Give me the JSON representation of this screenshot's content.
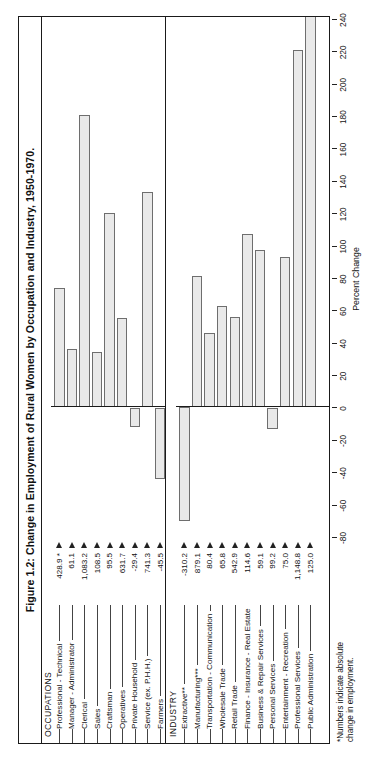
{
  "figure": {
    "title": "Figure 1.2: Change in Employment of Rural Women by Occupation and Industry, 1950-1970.",
    "footnote_line1": "*Numbers indicate absolute",
    "footnote_line2": "change in employment."
  },
  "axis": {
    "label": "Percent Change",
    "ticks": [
      "-80",
      "-60",
      "-40",
      "-20",
      "0",
      "20",
      "40",
      "60",
      "80",
      "100",
      "120",
      "140",
      "160",
      "180",
      "200",
      "220",
      "240"
    ]
  },
  "sections": {
    "occupations_title": "OCCUPATIONS",
    "industry_title": "INDUSTRY"
  },
  "chart_data": {
    "type": "bar",
    "orientation": "horizontal",
    "title": "Figure 1.2: Change in Employment of Rural Women by Occupation and Industry, 1950-1970.",
    "xlabel": "Percent Change",
    "ylabel": "",
    "xlim": [
      -80,
      240
    ],
    "grid": false,
    "legend": null,
    "note": "Value labels shown beside each category are the absolute change in employment (thousands); bar length is percent change.",
    "panels": [
      {
        "name": "OCCUPATIONS",
        "categories": [
          "Professional - Technical",
          "Manager - Administrator",
          "Clerical",
          "Sales",
          "Craftsman",
          "Operatives",
          "Private Household",
          "Service (ex. P.H.H.)",
          "Farmers",
          "Farm Labor",
          "Labor (ex. Farm)"
        ],
        "value_labels": [
          "428.9 *",
          "61.1",
          "1,083.2",
          "108.5",
          "95.5",
          "631.7",
          "-29.4",
          "741.3",
          "-45.5",
          "-324.4",
          ""
        ],
        "absolute_change": [
          428.9,
          61.1,
          1083.2,
          108.5,
          95.5,
          631.7,
          -29.4,
          741.3,
          -45.5,
          -324.4,
          null
        ],
        "percent_change": [
          74,
          36,
          181,
          34,
          120,
          55,
          -12,
          133,
          -44,
          -71,
          108
        ]
      },
      {
        "name": "INDUSTRY",
        "categories": [
          "Extractive**",
          "Manufacturing***",
          "Transportation - Communication",
          "Wholesale Trade",
          "Retail Trade",
          "Finance - Insurance - Real Estate",
          "Business & Repair Services",
          "Personal Services",
          "Entertainment - Recreation",
          "Professional Services",
          "Public Administration"
        ],
        "value_labels": [
          "-310.2",
          "879.1",
          "80.4",
          "65.8",
          "542.9",
          "114.6",
          "59.1",
          "99.2",
          "75.0",
          "1,148.8",
          "125.0"
        ],
        "absolute_change": [
          -310.2,
          879.1,
          80.4,
          65.8,
          542.9,
          114.6,
          59.1,
          99.2,
          75.0,
          1148.8,
          125.0
        ],
        "percent_change": [
          -70,
          81,
          46,
          63,
          56,
          107,
          97,
          -13,
          93,
          221,
          247
        ]
      }
    ]
  }
}
